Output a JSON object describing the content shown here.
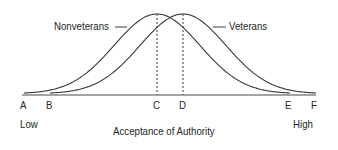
{
  "chart_data": {
    "type": "line",
    "title": "",
    "xlabel": "Acceptance of Authority",
    "ylabel": "",
    "x_endpoints": {
      "low": "Low",
      "high": "High"
    },
    "tick_labels": [
      "A",
      "B",
      "C",
      "D",
      "E",
      "F"
    ],
    "series": [
      {
        "name": "Nonveterans",
        "range": [
          "A",
          "E"
        ],
        "peak_at": "C",
        "shape": "normal"
      },
      {
        "name": "Veterans",
        "range": [
          "B",
          "F"
        ],
        "peak_at": "D",
        "shape": "normal"
      }
    ],
    "annotations": [
      "dashed vertical line at C (Nonveterans mean)",
      "dashed vertical line at D (Veterans mean)"
    ],
    "grid": false,
    "legend": "inline labels with leader lines"
  },
  "labels": {
    "nonveterans": "Nonveterans",
    "veterans": "Veterans",
    "ticks": {
      "a": "A",
      "b": "B",
      "c": "C",
      "d": "D",
      "e": "E",
      "f": "F"
    },
    "low": "Low",
    "high": "High",
    "axis_title": "Acceptance of Authority"
  },
  "colors": {
    "curve": "#3a3a3a",
    "text": "#231f20"
  }
}
